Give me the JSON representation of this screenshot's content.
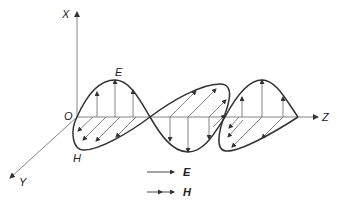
{
  "diagram": {
    "axes": {
      "x_label": "X",
      "y_label": "Y",
      "z_label": "Z",
      "origin_label": "O"
    },
    "wave_labels": {
      "e_label": "E",
      "h_label": "H"
    },
    "legend": [
      {
        "symbol": "single-arrow",
        "label": "E"
      },
      {
        "symbol": "double-arrow",
        "label": "H"
      }
    ],
    "colors": {
      "stroke": "#333333",
      "thin": "#666666",
      "background": "#ffffff"
    }
  }
}
